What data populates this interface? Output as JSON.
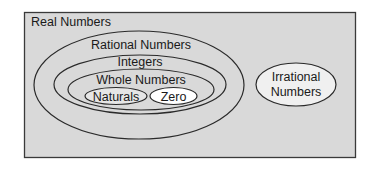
{
  "diagram": {
    "title": "Real Numbers",
    "colors": {
      "background": "#ffffff",
      "box_fill": "#d9d9d9",
      "box_stroke": "#3a3a3a",
      "ellipse_stroke": "#2a2a2a",
      "zero_fill": "#ffffff",
      "naturals_fill": "#e6e6e6",
      "irrational_fill": "#f0f0f0",
      "text": "#1a1a1a"
    },
    "sets": {
      "real": {
        "label": "Real Numbers"
      },
      "rational": {
        "label": "Rational Numbers"
      },
      "integers": {
        "label": "Integers"
      },
      "whole": {
        "label": "Whole Numbers"
      },
      "naturals": {
        "label": "Naturals"
      },
      "zero": {
        "label": "Zero"
      },
      "irrational": {
        "label_line1": "Irrational",
        "label_line2": "Numbers"
      }
    }
  }
}
